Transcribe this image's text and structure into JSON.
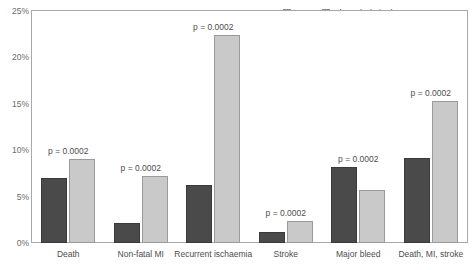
{
  "chart_data": {
    "type": "bar",
    "title": "",
    "xlabel": "",
    "ylabel": "",
    "ylim": [
      0,
      25
    ],
    "ytick_labels": [
      "0%",
      "5%",
      "10%",
      "15%",
      "20%",
      "25%"
    ],
    "ytick_values": [
      0,
      5,
      10,
      15,
      20,
      25
    ],
    "grid": false,
    "legend_position": "top-right",
    "categories": [
      "Death",
      "Non-fatal MI",
      "Recurrent ischaemia",
      "Stroke",
      "Major bleed",
      "Death, MI, stroke"
    ],
    "series": [
      {
        "name": "PCI",
        "color": "#4a4a4a",
        "values": [
          7.0,
          2.2,
          6.2,
          1.2,
          8.2,
          9.2
        ]
      },
      {
        "name": "Thrombolytic therapy",
        "color": "#c9c9c9",
        "values": [
          9.1,
          7.2,
          22.4,
          2.4,
          5.7,
          15.3
        ]
      }
    ],
    "annotations": [
      "p = 0.0002",
      "p = 0.0002",
      "p = 0.0002",
      "p = 0.0002",
      "p = 0.0002",
      "p = 0.0002"
    ]
  },
  "legend": {
    "entries": [
      {
        "label": "PCI",
        "color": "#4a4a4a"
      },
      {
        "label": "Thrombolytic therapy",
        "color": "#c9c9c9"
      }
    ]
  }
}
